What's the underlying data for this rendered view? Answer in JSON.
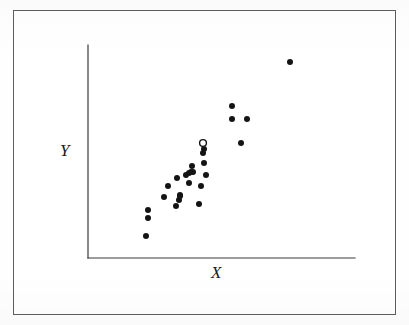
{
  "figure": {
    "background_color": "#ffffff",
    "border_color": "#5d5d5d",
    "ink_color": "#1d1d1d"
  },
  "labels": {
    "x_axis": "X",
    "y_axis": "Y"
  },
  "axes": {
    "origin_x": 88,
    "origin_y": 258,
    "y_axis_top": 45,
    "x_axis_right": 355,
    "line_color": "#3a3a3a",
    "line_width": 1.2
  },
  "chart_data": {
    "type": "scatter",
    "title": "",
    "xlabel": "X",
    "ylabel": "Y",
    "xlim": [
      0,
      100
    ],
    "ylim": [
      0,
      100
    ],
    "grid": false,
    "legend": null,
    "axis_ticks": false,
    "marker": {
      "filled_radius": 3.0,
      "open_radius": 3.4,
      "color": "#141414"
    },
    "points": [
      {
        "px": 146,
        "py": 236,
        "filled": true
      },
      {
        "px": 148,
        "py": 218,
        "filled": true
      },
      {
        "px": 148,
        "py": 210,
        "filled": true
      },
      {
        "px": 164,
        "py": 197,
        "filled": true
      },
      {
        "px": 168,
        "py": 186,
        "filled": true
      },
      {
        "px": 176,
        "py": 206,
        "filled": true
      },
      {
        "px": 179,
        "py": 200,
        "filled": true
      },
      {
        "px": 180,
        "py": 196,
        "filled": true
      },
      {
        "px": 180,
        "py": 195,
        "filled": true
      },
      {
        "px": 177,
        "py": 178,
        "filled": true
      },
      {
        "px": 186,
        "py": 175,
        "filled": true
      },
      {
        "px": 189,
        "py": 173,
        "filled": true
      },
      {
        "px": 191,
        "py": 172,
        "filled": true
      },
      {
        "px": 193,
        "py": 172,
        "filled": true
      },
      {
        "px": 192,
        "py": 166,
        "filled": true
      },
      {
        "px": 189,
        "py": 183,
        "filled": true
      },
      {
        "px": 199,
        "py": 204,
        "filled": true
      },
      {
        "px": 201,
        "py": 186,
        "filled": true
      },
      {
        "px": 206,
        "py": 175,
        "filled": true
      },
      {
        "px": 204,
        "py": 163,
        "filled": true
      },
      {
        "px": 203,
        "py": 153,
        "filled": true
      },
      {
        "px": 204,
        "py": 149,
        "filled": true
      },
      {
        "px": 203,
        "py": 143,
        "filled": false
      },
      {
        "px": 232,
        "py": 106,
        "filled": true
      },
      {
        "px": 232,
        "py": 119,
        "filled": true
      },
      {
        "px": 247,
        "py": 119,
        "filled": true
      },
      {
        "px": 241,
        "py": 143,
        "filled": true
      },
      {
        "px": 290,
        "py": 62,
        "filled": true
      }
    ]
  }
}
